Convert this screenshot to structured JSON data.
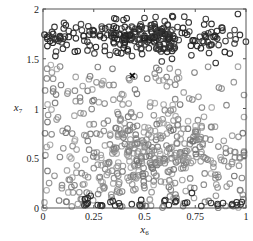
{
  "chart_data": {
    "type": "scatter",
    "title": "",
    "xlabel": "x6",
    "ylabel": "x7",
    "xlabel_base": "x",
    "xlabel_sub": "6",
    "ylabel_base": "x",
    "ylabel_sub": "7",
    "xlim": [
      0,
      1
    ],
    "ylim": [
      0,
      2
    ],
    "grid": false,
    "legend": null,
    "x_ticks": [
      {
        "value": 0,
        "label": "0"
      },
      {
        "value": 0.25,
        "label": "0.25"
      },
      {
        "value": 0.5,
        "label": "0.5"
      },
      {
        "value": 0.75,
        "label": "0.75"
      },
      {
        "value": 1,
        "label": "1"
      }
    ],
    "y_ticks": [
      {
        "value": 0,
        "label": "0"
      },
      {
        "value": 0.5,
        "label": "0.5"
      },
      {
        "value": 1,
        "label": "1"
      },
      {
        "value": 1.5,
        "label": "1.5"
      },
      {
        "value": 2,
        "label": "2"
      }
    ],
    "series": [
      {
        "name": "upper-cluster",
        "marker": "circle-open",
        "color": "#2a2a2a",
        "count": 260,
        "distribution": {
          "x_range": [
            0,
            1
          ],
          "y_center": 1.72,
          "y_spread": 0.09
        },
        "sample_points": [
          [
            0.02,
            1.72
          ],
          [
            0.05,
            1.75
          ],
          [
            0.1,
            1.7
          ],
          [
            0.15,
            1.76
          ],
          [
            0.2,
            1.73
          ],
          [
            0.25,
            1.78
          ],
          [
            0.3,
            1.71
          ],
          [
            0.35,
            1.74
          ],
          [
            0.4,
            1.69
          ],
          [
            0.45,
            1.77
          ],
          [
            0.5,
            1.73
          ],
          [
            0.55,
            1.72
          ],
          [
            0.6,
            1.75
          ],
          [
            0.65,
            1.7
          ],
          [
            0.7,
            1.76
          ],
          [
            0.75,
            1.68
          ],
          [
            0.8,
            1.73
          ],
          [
            0.85,
            1.72
          ],
          [
            0.97,
            1.74
          ],
          [
            0.36,
            1.9
          ],
          [
            0.5,
            1.91
          ],
          [
            0.64,
            1.92
          ],
          [
            0.83,
            1.85
          ],
          [
            0.96,
            1.95
          ]
        ]
      },
      {
        "name": "lower-scatter",
        "marker": "circle-open",
        "color": "#8a8a8a",
        "count": 520,
        "distribution": {
          "x_range": [
            0,
            1
          ],
          "y_range": [
            0,
            1.45
          ],
          "density_peak": [
            0.55,
            0.55
          ]
        },
        "sample_points": [
          [
            0.02,
            1.4
          ],
          [
            0.05,
            1.3
          ],
          [
            0.12,
            1.15
          ],
          [
            0.2,
            0.95
          ],
          [
            0.3,
            0.85
          ],
          [
            0.45,
            0.6
          ],
          [
            0.55,
            0.5
          ],
          [
            0.6,
            0.45
          ],
          [
            0.7,
            0.55
          ],
          [
            0.8,
            0.7
          ],
          [
            0.9,
            0.6
          ],
          [
            0.97,
            0.5
          ],
          [
            0.1,
            0.6
          ],
          [
            0.25,
            0.4
          ],
          [
            0.35,
            0.3
          ],
          [
            0.5,
            0.2
          ],
          [
            0.65,
            0.25
          ],
          [
            0.85,
            0.3
          ],
          [
            0.03,
            0.25
          ],
          [
            0.66,
            1.3
          ],
          [
            0.72,
            1.1
          ],
          [
            0.55,
            1.35
          ],
          [
            0.88,
            1.2
          ]
        ]
      },
      {
        "name": "bottom-dark",
        "marker": "circle-open",
        "color": "#2a2a2a",
        "count": 30,
        "distribution": {
          "x_range": [
            0.2,
            1
          ],
          "y_center": 0.04,
          "y_spread": 0.05
        },
        "sample_points": [
          [
            0.22,
            0.1
          ],
          [
            0.22,
            0.05
          ],
          [
            0.38,
            0.02
          ],
          [
            0.48,
            0.02
          ],
          [
            0.62,
            0.03
          ],
          [
            0.7,
            0.05
          ],
          [
            0.78,
            0.02
          ],
          [
            0.86,
            0.04
          ],
          [
            0.93,
            0.03
          ],
          [
            0.98,
            0.06
          ]
        ]
      }
    ],
    "annotations": [
      {
        "type": "x-marker",
        "x": 0.44,
        "y": 1.33,
        "color": "#111111"
      }
    ]
  }
}
